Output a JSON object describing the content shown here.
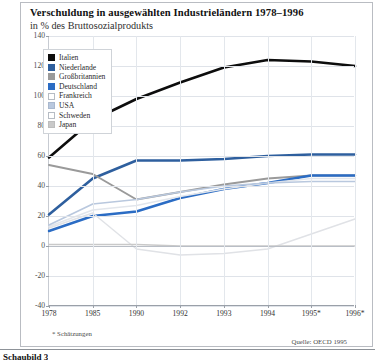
{
  "header": {
    "title": "Verschuldung in ausgewählten Industrieländern 1978–1996",
    "subtitle": "in % des Bruttosozialprodukts"
  },
  "footnote": "* Schätzungen",
  "source": "Quelle: OECD 1995",
  "caption": "Schaubild 3",
  "colors": {
    "italien": "#0d0d0d",
    "niederlande": "#2e5f9e",
    "grossbritannien": "#9a9a9a",
    "deutschland": "#2b6cc4",
    "frankreich": "#ffffff",
    "usa": "#b9c8de",
    "schweden": "#ffffff",
    "japan": "#c9c9c9",
    "grid": "#dfe3e9",
    "axis": "#9aa0a8",
    "frame": "#b9bcc2"
  },
  "chart_data": {
    "type": "line",
    "title": "Verschuldung in ausgewählten Industrieländern 1978–1996",
    "subtitle": "in % des Bruttosozialprodukts",
    "xlabel": "",
    "ylabel": "in % des Bruttosozialprodukts",
    "categories": [
      "1978",
      "1985",
      "1990",
      "1992",
      "1993",
      "1994",
      "1995*",
      "1996*"
    ],
    "ylim": [
      -40,
      140
    ],
    "yticks": [
      -40,
      -20,
      0,
      20,
      40,
      60,
      80,
      100,
      120,
      140
    ],
    "grid": true,
    "legend_position": "upper-left",
    "series": [
      {
        "name": "Italien",
        "color": "#0d0d0d",
        "values": [
          59,
          84,
          98,
          109,
          119,
          124,
          123,
          120
        ]
      },
      {
        "name": "Niederlande",
        "color": "#2e5f9e",
        "values": [
          21,
          45,
          57,
          57,
          58,
          60,
          61,
          61
        ]
      },
      {
        "name": "Großbritannien",
        "color": "#9a9a9a",
        "values": [
          54,
          48,
          31,
          36,
          41,
          45,
          47,
          47
        ]
      },
      {
        "name": "Deutschland",
        "color": "#2b6cc4",
        "values": [
          10,
          20,
          23,
          32,
          38,
          42,
          47,
          47
        ]
      },
      {
        "name": "Frankreich",
        "color": "#e2e6ec",
        "values": [
          13,
          24,
          27,
          33,
          38,
          42,
          45,
          45
        ]
      },
      {
        "name": "USA",
        "color": "#b9c8de",
        "values": [
          14,
          28,
          31,
          36,
          40,
          42,
          43,
          43
        ]
      },
      {
        "name": "Schweden",
        "color": "#e0e2e6",
        "values": [
          12,
          22,
          -2,
          -6,
          -5,
          -2,
          8,
          18
        ]
      },
      {
        "name": "Japan",
        "color": "#c9c9c9",
        "values": [
          1,
          1,
          1,
          0,
          0,
          0,
          0,
          0
        ]
      }
    ]
  },
  "legend": {
    "items": [
      {
        "label": "Italien",
        "swatch": "#0d0d0d",
        "border": "#0d0d0d"
      },
      {
        "label": "Niederlande",
        "swatch": "#2e5f9e",
        "border": "#2e5f9e"
      },
      {
        "label": "Großbritannien",
        "swatch": "#9a9a9a",
        "border": "#9a9a9a"
      },
      {
        "label": "Deutschland",
        "swatch": "#2b6cc4",
        "border": "#2b6cc4"
      },
      {
        "label": "Frankreich",
        "swatch": "#ffffff",
        "border": "#b6bcc4"
      },
      {
        "label": "USA",
        "swatch": "#b9c8de",
        "border": "#a9b8ce"
      },
      {
        "label": "Schweden",
        "swatch": "#ffffff",
        "border": "#b6bcc4"
      },
      {
        "label": "Japan",
        "swatch": "#c9c9c9",
        "border": "#bdbdbd"
      }
    ]
  }
}
